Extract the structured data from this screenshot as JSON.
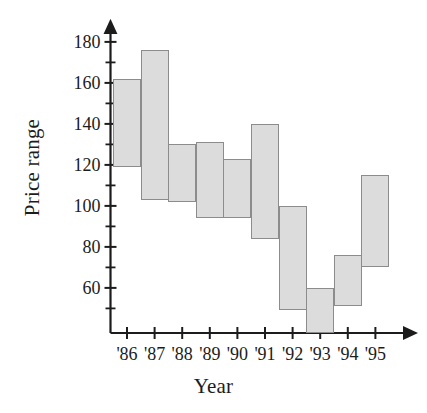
{
  "chart_data": {
    "type": "bar",
    "title": "",
    "subtitle": "",
    "xlabel": "Year",
    "ylabel": "Price range",
    "categories": [
      "'86",
      "'87",
      "'88",
      "'89",
      "'90",
      "'91",
      "'92",
      "'93",
      "'94",
      "'95"
    ],
    "series": [
      {
        "name": "Price range",
        "type": "range",
        "low": [
          119,
          103,
          102,
          94,
          94,
          84,
          49,
          38,
          51,
          70
        ],
        "high": [
          162,
          176,
          130,
          131,
          123,
          140,
          100,
          60,
          76,
          115
        ]
      }
    ],
    "ylim": [
      38,
      186
    ],
    "xlim": [
      0,
      11
    ],
    "ytick_labels": [
      "180",
      "160",
      "140",
      "120",
      "100",
      "80",
      "60"
    ],
    "ytick_values": [
      180,
      160,
      140,
      120,
      100,
      80,
      60
    ],
    "yminor_step": 10,
    "grid": false,
    "legend": null,
    "annotations": [],
    "axis_color": "#1c1c1c",
    "bar_fill": "#dcdcdc",
    "bar_edge": "#8c8c8c"
  },
  "axes": {
    "y_title": "Price range",
    "x_title": "Year"
  }
}
